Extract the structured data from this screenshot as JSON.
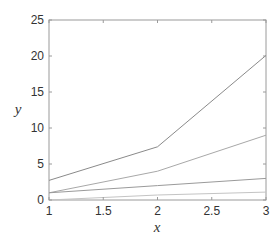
{
  "chart_data": {
    "type": "line",
    "title": "",
    "xlabel": "x",
    "ylabel": "y",
    "xlim": [
      1,
      3
    ],
    "ylim": [
      0,
      25
    ],
    "grid": false,
    "legend": null,
    "xticks": [
      "1",
      "1.5",
      "2",
      "2.5",
      "3"
    ],
    "yticks": [
      "0",
      "5",
      "10",
      "15",
      "20",
      "25"
    ],
    "x": [
      1,
      2,
      3
    ],
    "series": [
      {
        "name": "series-1",
        "values": [
          2.72,
          7.39,
          20.09
        ],
        "color": "#8a8a8a"
      },
      {
        "name": "series-2",
        "values": [
          1,
          4,
          9
        ],
        "color": "#a8a8a8"
      },
      {
        "name": "series-3",
        "values": [
          1,
          2,
          3
        ],
        "color": "#9a9a9a"
      },
      {
        "name": "series-4",
        "values": [
          0,
          0.69,
          1.1
        ],
        "color": "#c4c4c4"
      }
    ]
  }
}
